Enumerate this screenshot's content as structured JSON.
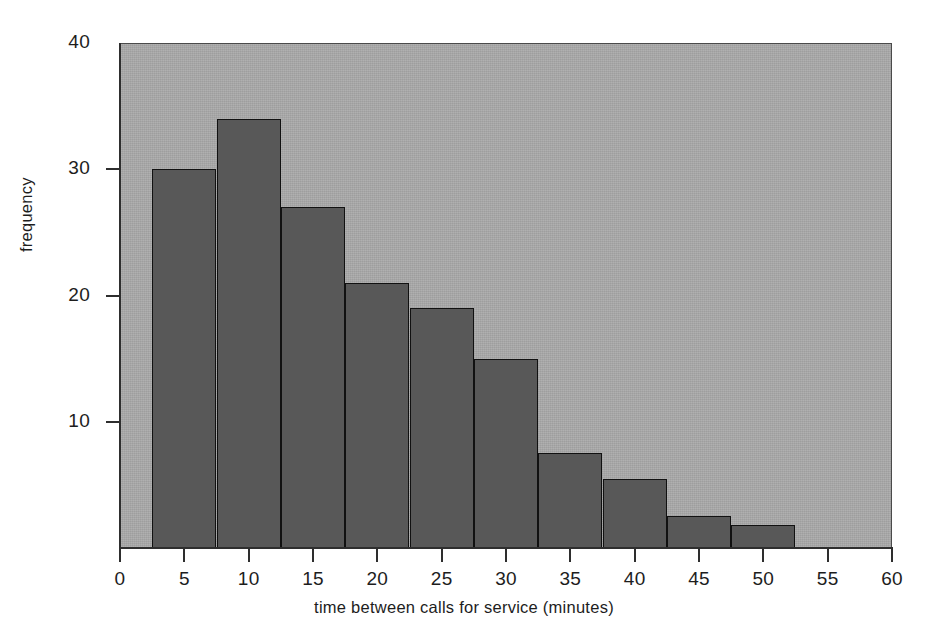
{
  "chart_data": {
    "type": "bar",
    "title": "",
    "subtitle": "",
    "xlabel": "time between calls for service (minutes)",
    "ylabel": "frequency",
    "xlim": [
      0,
      60
    ],
    "ylim": [
      0,
      40
    ],
    "grid": false,
    "legend": "none",
    "bin_width": 5,
    "bin_edges": [
      2.5,
      7.5,
      12.5,
      17.5,
      22.5,
      27.5,
      32.5,
      37.5,
      42.5,
      47.5,
      52.5
    ],
    "categories": [
      "2.5-7.5",
      "7.5-12.5",
      "12.5-17.5",
      "17.5-22.5",
      "22.5-27.5",
      "27.5-32.5",
      "32.5-37.5",
      "37.5-42.5",
      "42.5-47.5",
      "47.5-52.5"
    ],
    "values": [
      30,
      34,
      27,
      21,
      19,
      15,
      7.5,
      5.5,
      2.5,
      1.8
    ],
    "xticks": [
      0,
      5,
      10,
      15,
      20,
      25,
      30,
      35,
      40,
      45,
      50,
      55,
      60
    ],
    "xtick_labels": [
      "0",
      "5",
      "10",
      "15",
      "20",
      "25",
      "30",
      "35",
      "40",
      "45",
      "50",
      "55",
      "60"
    ],
    "yticks": [
      10,
      20,
      30,
      40
    ],
    "ytick_labels": [
      "10",
      "20",
      "30",
      "40"
    ],
    "colors": {
      "bar_fill": "#585858",
      "bar_edge": "#111111",
      "plot_background": "#a9a9a9",
      "axis": "#2e2e2e",
      "text": "#1d1d1d",
      "page_background": "#ffffff"
    }
  }
}
